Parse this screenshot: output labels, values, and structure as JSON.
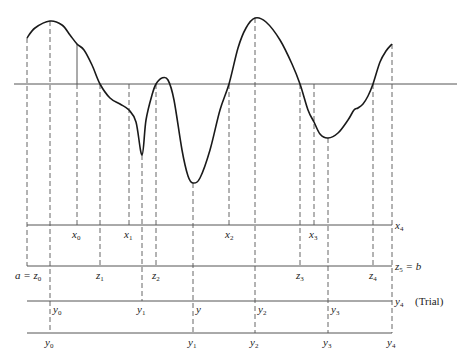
{
  "figure": {
    "type": "diagram",
    "curve_points": [
      [
        27,
        38
      ],
      [
        35,
        28
      ],
      [
        50,
        21
      ],
      [
        62,
        25
      ],
      [
        70,
        35
      ],
      [
        77,
        44
      ],
      [
        84,
        50
      ],
      [
        92,
        65
      ],
      [
        100,
        84
      ],
      [
        110,
        98
      ],
      [
        120,
        104
      ],
      [
        129,
        110
      ],
      [
        136,
        122
      ],
      [
        142,
        155
      ],
      [
        146,
        120
      ],
      [
        152,
        95
      ],
      [
        156,
        84
      ],
      [
        162,
        78
      ],
      [
        168,
        80
      ],
      [
        174,
        100
      ],
      [
        182,
        150
      ],
      [
        188,
        176
      ],
      [
        193,
        183
      ],
      [
        200,
        178
      ],
      [
        210,
        150
      ],
      [
        220,
        110
      ],
      [
        229,
        84
      ],
      [
        238,
        48
      ],
      [
        246,
        28
      ],
      [
        255,
        18
      ],
      [
        266,
        22
      ],
      [
        280,
        40
      ],
      [
        292,
        64
      ],
      [
        300,
        84
      ],
      [
        308,
        110
      ],
      [
        314,
        122
      ],
      [
        320,
        134
      ],
      [
        328,
        138
      ],
      [
        338,
        133
      ],
      [
        348,
        120
      ],
      [
        354,
        110
      ],
      [
        358,
        108
      ],
      [
        363,
        104
      ],
      [
        368,
        96
      ],
      [
        373,
        84
      ],
      [
        380,
        62
      ],
      [
        386,
        51
      ],
      [
        392,
        44
      ]
    ],
    "axis_top_y": 84,
    "axis_x_left": 14,
    "axis_x_right": 457,
    "rows": [
      {
        "name": "x-row",
        "y": 225,
        "x_start": 27,
        "x_end": 392
      },
      {
        "name": "z-row",
        "y": 266,
        "x_start": 27,
        "x_end": 392
      },
      {
        "name": "y-trial-row",
        "y": 301,
        "x_start": 27,
        "x_end": 392
      },
      {
        "name": "y-row",
        "y": 333,
        "x_start": 27,
        "x_end": 392
      }
    ],
    "verticals": [
      {
        "x": 27,
        "y_top": 38,
        "y_bottom": 266,
        "style": "dashed"
      },
      {
        "x": 50,
        "y_top": 21,
        "y_bottom": 333,
        "style": "dashed"
      },
      {
        "x": 77,
        "y_top": 44,
        "y_bottom": 225,
        "style": "solid-then-dashed"
      },
      {
        "x": 100,
        "y_top": 84,
        "y_bottom": 266,
        "style": "dashed"
      },
      {
        "x": 129,
        "y_top": 84,
        "y_bottom": 225,
        "style": "solid-then-dashed"
      },
      {
        "x": 142,
        "y_top": 155,
        "y_bottom": 301,
        "style": "dashed"
      },
      {
        "x": 156,
        "y_top": 84,
        "y_bottom": 266,
        "style": "dashed"
      },
      {
        "x": 193,
        "y_top": 183,
        "y_bottom": 333,
        "style": "dashed"
      },
      {
        "x": 229,
        "y_top": 84,
        "y_bottom": 225,
        "style": "dashed"
      },
      {
        "x": 255,
        "y_top": 18,
        "y_bottom": 333,
        "style": "dashed"
      },
      {
        "x": 300,
        "y_top": 84,
        "y_bottom": 266,
        "style": "dashed"
      },
      {
        "x": 314,
        "y_top": 84,
        "y_bottom": 225,
        "style": "solid-then-dashed"
      },
      {
        "x": 328,
        "y_top": 138,
        "y_bottom": 333,
        "style": "dashed"
      },
      {
        "x": 373,
        "y_top": 84,
        "y_bottom": 266,
        "style": "dashed"
      },
      {
        "x": 392,
        "y_top": 44,
        "y_bottom": 333,
        "style": "dashed"
      }
    ]
  },
  "labels": {
    "x_row": {
      "x0": {
        "base": "x",
        "sub": "0"
      },
      "x1": {
        "base": "x",
        "sub": "1"
      },
      "x2": {
        "base": "x",
        "sub": "2"
      },
      "x3": {
        "base": "x",
        "sub": "3"
      },
      "x4": {
        "base": "x",
        "sub": "4"
      }
    },
    "z_row": {
      "z0": {
        "prefix": "a = ",
        "base": "z",
        "sub": "0"
      },
      "z1": {
        "base": "z",
        "sub": "1"
      },
      "z2": {
        "base": "z",
        "sub": "2"
      },
      "z3": {
        "base": "z",
        "sub": "3"
      },
      "z4": {
        "base": "z",
        "sub": "4"
      },
      "z5": {
        "base": "z",
        "sub": "5",
        "suffix": " = b"
      }
    },
    "trial_row": {
      "y0": {
        "base": "y",
        "sub": "0"
      },
      "y1": {
        "base": "y",
        "sub": "1"
      },
      "y": {
        "base": "y"
      },
      "y2": {
        "base": "y",
        "sub": "2"
      },
      "y3": {
        "base": "y",
        "sub": "3"
      },
      "y4": {
        "base": "y",
        "sub": "4"
      },
      "trial": "(Trial)"
    },
    "y_row": {
      "y0": {
        "base": "y",
        "sub": "0"
      },
      "y1": {
        "base": "y",
        "sub": "1"
      },
      "y2": {
        "base": "y",
        "sub": "2"
      },
      "y3": {
        "base": "y",
        "sub": "3"
      },
      "y4": {
        "base": "y",
        "sub": "4"
      }
    }
  },
  "colors": {
    "ink": "#222222",
    "line": "#555555",
    "background": "#ffffff"
  }
}
